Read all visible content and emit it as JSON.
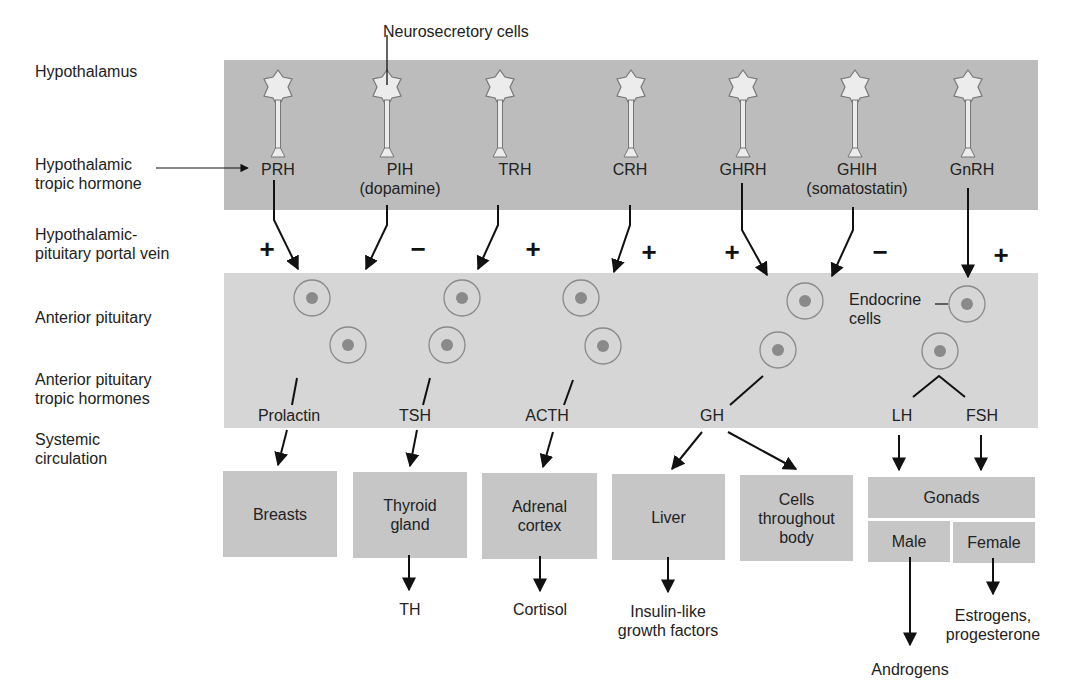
{
  "labels": {
    "neurosecretory": "Neurosecretory cells",
    "hypothalamus": "Hypothalamus",
    "hyp_tropic_1": "Hypothalamic",
    "hyp_tropic_2": "tropic hormone",
    "portal_1": "Hypothalamic-",
    "portal_2": "pituitary portal vein",
    "anterior_pituitary": "Anterior pituitary",
    "ap_tropic_1": "Anterior pituitary",
    "ap_tropic_2": "tropic hormones",
    "systemic_1": "Systemic",
    "systemic_2": "circulation",
    "endocrine_1": "Endocrine",
    "endocrine_2": "cells"
  },
  "hypothalamic_hormones": [
    {
      "name": "PRH",
      "sub": "",
      "effect": "+"
    },
    {
      "name": "PIH",
      "sub": "(dopamine)",
      "effect": "−"
    },
    {
      "name": "TRH",
      "sub": "",
      "effect": "+"
    },
    {
      "name": "CRH",
      "sub": "",
      "effect": "+"
    },
    {
      "name": "GHRH",
      "sub": "",
      "effect": "+"
    },
    {
      "name": "GHIH",
      "sub": "(somatostatin)",
      "effect": "−"
    },
    {
      "name": "GnRH",
      "sub": "",
      "effect": "+"
    }
  ],
  "pituitary_hormones": [
    "Prolactin",
    "TSH",
    "ACTH",
    "GH",
    "LH",
    "FSH"
  ],
  "targets": [
    {
      "name": "Breasts",
      "output": ""
    },
    {
      "name": "Thyroid gland",
      "output": "TH"
    },
    {
      "name": "Adrenal cortex",
      "output": "Cortisol"
    },
    {
      "name": "Liver",
      "output": "Insulin-like growth factors"
    },
    {
      "name": "Cells throughout body",
      "output": ""
    }
  ],
  "gonads": {
    "name": "Gonads",
    "male": "Male",
    "female": "Female",
    "male_output": "Androgens",
    "female_output_1": "Estrogens,",
    "female_output_2": "progesterone"
  },
  "target_lines": {
    "thyroid_1": "Thyroid",
    "thyroid_2": "gland",
    "adrenal_1": "Adrenal",
    "adrenal_2": "cortex",
    "cells_1": "Cells",
    "cells_2": "throughout",
    "cells_3": "body",
    "igf_1": "Insulin-like",
    "igf_2": "growth factors"
  },
  "colors": {
    "hypothalamus_band": "#bcbcbc",
    "pituitary_band": "#d6d6d6",
    "target_box": "#c6c6c6",
    "cell_nucleus": "#8a8a8a"
  }
}
